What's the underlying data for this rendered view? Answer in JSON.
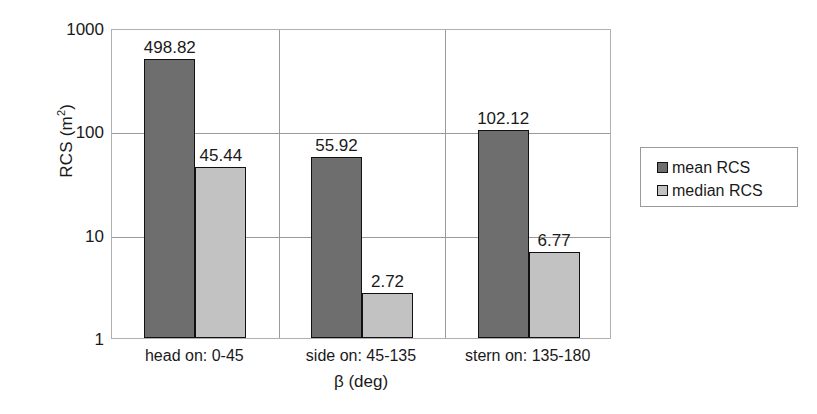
{
  "chart_data": {
    "type": "bar",
    "title": "",
    "xlabel": "β (deg)",
    "ylabel": "RCS (m²)",
    "ylabel_base": "RCS (m",
    "ylabel_sup": "2",
    "ylabel_tail": ")",
    "yscale": "log",
    "ylim": [
      1,
      1000
    ],
    "ytick_labels": [
      "1000",
      "100",
      "10",
      "1"
    ],
    "ytick_values": [
      1000,
      100,
      10,
      1
    ],
    "grid": true,
    "grid_vertical_separators": true,
    "legend_position": "right",
    "categories": [
      "head on:  0-45",
      "side on: 45-135",
      "stern on: 135-180"
    ],
    "series": [
      {
        "name": "mean RCS",
        "color": "#6e6e6e",
        "values": [
          498.82,
          55.92,
          102.12
        ],
        "labels": [
          "498.82",
          "55.92",
          "102.12"
        ]
      },
      {
        "name": "median RCS",
        "color": "#c2c2c2",
        "values": [
          45.44,
          2.72,
          6.77
        ],
        "labels": [
          "45.44",
          "2.72",
          "6.77"
        ]
      }
    ]
  },
  "legend": {
    "items": [
      {
        "label": "mean RCS",
        "color": "#6e6e6e"
      },
      {
        "label": "median RCS",
        "color": "#c2c2c2"
      }
    ]
  },
  "colors": {
    "mean_bar": "#6e6e6e",
    "median_bar": "#c2c2c2",
    "bar_outline": "#111111",
    "gridline": "#9a9a9a",
    "plot_border": "#b0b0b0",
    "text": "#1a1a1a",
    "background": "#ffffff"
  }
}
